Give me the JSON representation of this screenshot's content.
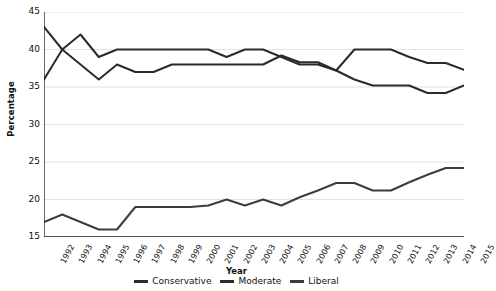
{
  "chart_data": {
    "type": "line",
    "title": "",
    "xlabel": "Year",
    "ylabel": "Percentage",
    "ylim": [
      15,
      45
    ],
    "yticks": [
      15,
      20,
      25,
      30,
      35,
      40,
      45
    ],
    "grid": true,
    "legend_position": "bottom",
    "categories": [
      "1992",
      "1993",
      "1994",
      "1995",
      "1996",
      "1997",
      "1998",
      "1999",
      "2000",
      "2001",
      "2002",
      "2003",
      "2004",
      "2005",
      "2006",
      "2007",
      "2008",
      "2009",
      "2010",
      "2011",
      "2012",
      "2013",
      "2014",
      "2015"
    ],
    "series": [
      {
        "name": "Conservative",
        "color": "#2b2b2b",
        "values": [
          43,
          40,
          42,
          39,
          40,
          40,
          40,
          40,
          40,
          40,
          39,
          40,
          40,
          39,
          38,
          38,
          37.2,
          40,
          40,
          40,
          39,
          38.2,
          38.2,
          37.3
        ]
      },
      {
        "name": "Moderate",
        "color": "#2b2b2b",
        "values": [
          36,
          40,
          38,
          36,
          38,
          37,
          37,
          38,
          38,
          38,
          38,
          38,
          38,
          39.2,
          38.3,
          38.3,
          37.2,
          36,
          35.2,
          35.2,
          35.2,
          34.2,
          34.2,
          35.2
        ]
      },
      {
        "name": "Liberal",
        "color": "#3c3c3c",
        "values": [
          17,
          18,
          17,
          16,
          16,
          19,
          19,
          19,
          19,
          19.2,
          20,
          19.2,
          20,
          19.2,
          20.3,
          21.2,
          22.2,
          22.2,
          21.2,
          21.2,
          22.3,
          23.3,
          24.2,
          24.2
        ]
      }
    ]
  },
  "legend": {
    "items": [
      {
        "label": "Conservative"
      },
      {
        "label": "Moderate"
      },
      {
        "label": "Liberal"
      }
    ]
  },
  "axes": {
    "x_title": "Year",
    "y_title": "Percentage"
  }
}
